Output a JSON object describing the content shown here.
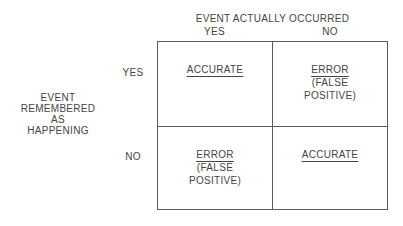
{
  "matrix": {
    "column_axis_title": "EVENT ACTUALLY OCCURRED",
    "column_headers": [
      "YES",
      "NO"
    ],
    "row_axis_title_lines": [
      "EVENT",
      "REMEMBERED",
      "AS",
      "HAPPENING"
    ],
    "row_headers": [
      "YES",
      "NO"
    ],
    "cells": [
      {
        "row": "YES",
        "column": "YES",
        "result": "ACCURATE"
      },
      {
        "row": "YES",
        "column": "NO",
        "result": "ERROR",
        "detail_line1": "(FALSE",
        "detail_line2": "POSITIVE)"
      },
      {
        "row": "NO",
        "column": "YES",
        "result": "ERROR",
        "detail_line1": "(FALSE",
        "detail_line2": "POSITIVE)"
      },
      {
        "row": "NO",
        "column": "NO",
        "result": "ACCURATE"
      }
    ],
    "colors": {
      "line": "#5a5a5a",
      "text": "#454545",
      "background": "#ffffff"
    }
  }
}
